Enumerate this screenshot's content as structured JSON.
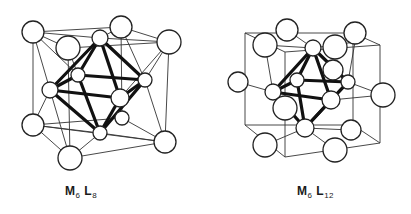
{
  "figures": [
    {
      "id": "left",
      "caption": {
        "main1": "M",
        "sub1": "6",
        "main2": " L",
        "sub2": "8"
      },
      "description": "M6L8 cluster: metal octahedron with 8 ligands capping faces, within a cube frame",
      "thin_lines": [
        [
          33,
          32,
          121,
          27
        ],
        [
          121,
          27,
          169,
          42
        ],
        [
          33,
          32,
          68,
          48
        ],
        [
          68,
          48,
          169,
          42
        ],
        [
          33,
          32,
          33,
          125
        ],
        [
          33,
          125,
          70,
          158
        ],
        [
          70,
          158,
          165,
          142
        ],
        [
          165,
          142,
          169,
          42
        ],
        [
          33,
          125,
          165,
          142
        ],
        [
          121,
          27,
          122,
          118
        ],
        [
          33,
          125,
          122,
          118
        ],
        [
          122,
          118,
          165,
          142
        ],
        [
          68,
          48,
          70,
          158
        ],
        [
          100,
          38,
          33,
          32
        ],
        [
          100,
          38,
          169,
          42
        ],
        [
          100,
          38,
          121,
          27
        ],
        [
          33,
          32,
          78,
          75
        ],
        [
          33,
          32,
          50,
          90
        ],
        [
          169,
          42,
          145,
          80
        ],
        [
          169,
          42,
          120,
          98
        ],
        [
          33,
          125,
          50,
          90
        ],
        [
          33,
          125,
          100,
          133
        ],
        [
          165,
          142,
          145,
          80
        ],
        [
          165,
          142,
          100,
          133
        ],
        [
          70,
          158,
          100,
          133
        ],
        [
          70,
          158,
          50,
          90
        ],
        [
          121,
          27,
          145,
          80
        ],
        [
          68,
          48,
          78,
          75
        ]
      ],
      "thick_lines": [
        [
          100,
          38,
          78,
          75
        ],
        [
          100,
          38,
          145,
          80
        ],
        [
          100,
          38,
          120,
          98
        ],
        [
          100,
          38,
          50,
          90
        ],
        [
          78,
          75,
          145,
          80
        ],
        [
          78,
          75,
          50,
          90
        ],
        [
          50,
          90,
          120,
          98
        ],
        [
          145,
          80,
          120,
          98
        ],
        [
          50,
          90,
          100,
          133
        ],
        [
          120,
          98,
          100,
          133
        ],
        [
          145,
          80,
          100,
          133
        ],
        [
          78,
          75,
          100,
          133
        ]
      ],
      "spheres": [
        {
          "x": 78,
          "y": 75,
          "r": 7
        },
        {
          "x": 122,
          "y": 118,
          "r": 7
        },
        {
          "x": 33,
          "y": 32,
          "r": 11
        },
        {
          "x": 121,
          "y": 27,
          "r": 11
        },
        {
          "x": 169,
          "y": 42,
          "r": 12
        },
        {
          "x": 33,
          "y": 125,
          "r": 11
        },
        {
          "x": 165,
          "y": 142,
          "r": 11
        },
        {
          "x": 100,
          "y": 38,
          "r": 8
        },
        {
          "x": 145,
          "y": 80,
          "r": 7
        },
        {
          "x": 50,
          "y": 90,
          "r": 8
        },
        {
          "x": 68,
          "y": 48,
          "r": 12
        },
        {
          "x": 100,
          "y": 133,
          "r": 7
        },
        {
          "x": 120,
          "y": 98,
          "r": 9
        },
        {
          "x": 70,
          "y": 158,
          "r": 12
        }
      ]
    },
    {
      "id": "right",
      "caption": {
        "main1": "M",
        "sub1": "6",
        "main2": " L",
        "sub2": "12"
      },
      "description": "M6L12 cluster: metal octahedron with 12 ligands bridging edges, within a cube frame",
      "thin_lines": [
        [
          40,
          33,
          148,
          33
        ],
        [
          148,
          33,
          175,
          45
        ],
        [
          40,
          33,
          40,
          125
        ],
        [
          175,
          45,
          175,
          143
        ],
        [
          40,
          125,
          80,
          157
        ],
        [
          80,
          157,
          175,
          143
        ],
        [
          40,
          125,
          148,
          125
        ],
        [
          148,
          125,
          175,
          143
        ],
        [
          80,
          157,
          80,
          52
        ],
        [
          80,
          52,
          175,
          45
        ],
        [
          40,
          33,
          80,
          52
        ],
        [
          148,
          33,
          148,
          125
        ],
        [
          60,
          45,
          108,
          48
        ],
        [
          108,
          48,
          150,
          42
        ],
        [
          33,
          82,
          68,
          92
        ],
        [
          68,
          92,
          108,
          48
        ],
        [
          143,
          82,
          178,
          95
        ],
        [
          126,
          100,
          178,
          95
        ],
        [
          60,
          145,
          100,
          128
        ],
        [
          100,
          128,
          146,
          130
        ],
        [
          130,
          150,
          100,
          128
        ],
        [
          82,
          30,
          108,
          48
        ],
        [
          150,
          42,
          143,
          82
        ],
        [
          60,
          45,
          68,
          92
        ]
      ],
      "thick_lines": [
        [
          108,
          48,
          68,
          92
        ],
        [
          108,
          48,
          126,
          100
        ],
        [
          108,
          48,
          143,
          82
        ],
        [
          108,
          48,
          92,
          80
        ],
        [
          92,
          80,
          143,
          82
        ],
        [
          92,
          80,
          68,
          92
        ],
        [
          68,
          92,
          126,
          100
        ],
        [
          143,
          82,
          126,
          100
        ],
        [
          68,
          92,
          100,
          128
        ],
        [
          126,
          100,
          100,
          128
        ],
        [
          143,
          82,
          100,
          128
        ],
        [
          92,
          80,
          100,
          128
        ]
      ],
      "spheres": [
        {
          "x": 82,
          "y": 30,
          "r": 11
        },
        {
          "x": 150,
          "y": 33,
          "r": 11
        },
        {
          "x": 60,
          "y": 45,
          "r": 12
        },
        {
          "x": 130,
          "y": 47,
          "r": 12
        },
        {
          "x": 108,
          "y": 48,
          "r": 8
        },
        {
          "x": 128,
          "y": 70,
          "r": 10
        },
        {
          "x": 92,
          "y": 80,
          "r": 7
        },
        {
          "x": 33,
          "y": 82,
          "r": 10
        },
        {
          "x": 143,
          "y": 82,
          "r": 7
        },
        {
          "x": 178,
          "y": 95,
          "r": 12
        },
        {
          "x": 68,
          "y": 92,
          "r": 8
        },
        {
          "x": 80,
          "y": 108,
          "r": 12
        },
        {
          "x": 126,
          "y": 100,
          "r": 9
        },
        {
          "x": 146,
          "y": 130,
          "r": 10
        },
        {
          "x": 60,
          "y": 145,
          "r": 12
        },
        {
          "x": 100,
          "y": 128,
          "r": 9
        },
        {
          "x": 130,
          "y": 150,
          "r": 12
        }
      ]
    }
  ]
}
